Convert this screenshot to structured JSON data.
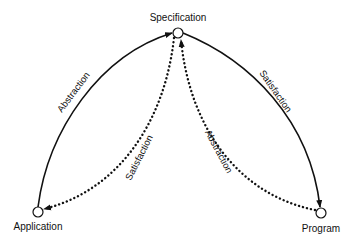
{
  "diagram": {
    "nodes": [
      {
        "id": "specification",
        "label": "Specification"
      },
      {
        "id": "application",
        "label": "Application"
      },
      {
        "id": "program",
        "label": "Program"
      }
    ],
    "edges": [
      {
        "from": "application",
        "to": "specification",
        "label": "Abstraction",
        "style": "solid"
      },
      {
        "from": "specification",
        "to": "program",
        "label": "Satisfaction",
        "style": "solid"
      },
      {
        "from": "specification",
        "to": "application",
        "label": "Satisfaction",
        "style": "dotted"
      },
      {
        "from": "program",
        "to": "specification",
        "label": "Abstraction",
        "style": "dotted"
      }
    ],
    "colors": {
      "stroke": "#111111",
      "node_fill": "#ffffff",
      "background": "#ffffff"
    }
  }
}
